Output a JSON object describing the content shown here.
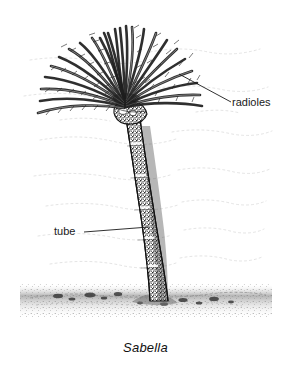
{
  "figure": {
    "caption": "Sabella",
    "organism": "Sabella",
    "illustration_style": "black-and-white stippled line drawing",
    "background_color": "#ffffff",
    "ink_color": "#1a1a1a"
  },
  "labels": [
    {
      "id": "radioles",
      "text": "radioles",
      "leader_from": {
        "x": 179,
        "y": 74
      },
      "leader_to": {
        "x": 231,
        "y": 102
      }
    },
    {
      "id": "tube",
      "text": "tube",
      "leader_from": {
        "x": 149,
        "y": 227
      },
      "leader_to": {
        "x": 84,
        "y": 232
      }
    }
  ],
  "anatomy": {
    "crown": {
      "name": "radiolar crown",
      "center": {
        "x": 125,
        "y": 112
      },
      "radiole_count": 26,
      "span_left_x": 16,
      "span_right_x": 205,
      "top_y": 22
    },
    "collar": {
      "name": "collar",
      "center": {
        "x": 129,
        "y": 118
      }
    },
    "tube": {
      "name": "tube",
      "top": {
        "x": 133,
        "y": 120
      },
      "base": {
        "x": 152,
        "y": 300
      },
      "width_top": 14,
      "width_base": 18,
      "band_count": 6
    },
    "substrate": {
      "name": "sea floor sediment",
      "line_y": 298,
      "left_x": 28,
      "right_x": 268
    },
    "water": {
      "name": "background water striations",
      "line_count": 9
    }
  }
}
